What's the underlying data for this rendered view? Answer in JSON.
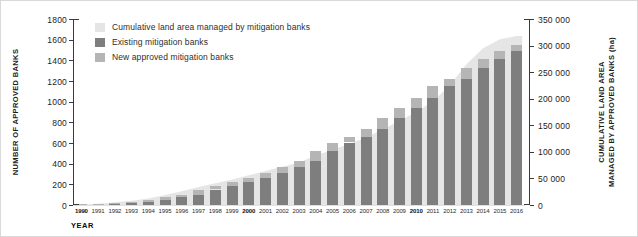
{
  "chart_data": {
    "type": "bar",
    "subtype": "stacked-bars-with-background-area",
    "categories": [
      "1990",
      "1991",
      "1992",
      "1993",
      "1994",
      "1995",
      "1996",
      "1997",
      "1998",
      "1999",
      "2000",
      "2001",
      "2002",
      "2003",
      "2004",
      "2005",
      "2006",
      "2007",
      "2008",
      "2009",
      "2010",
      "2011",
      "2012",
      "2013",
      "2014",
      "2015",
      "2016"
    ],
    "series": [
      {
        "name": "Cumulative land area managed by mitigation banks",
        "type": "area",
        "axis": "right",
        "color": "#e5e5e5",
        "values": [
          1000,
          2500,
          5000,
          8000,
          12000,
          19000,
          26000,
          34000,
          41000,
          48000,
          56000,
          64000,
          72000,
          80000,
          93000,
          104000,
          115000,
          127000,
          142000,
          158000,
          175000,
          195000,
          225000,
          265000,
          295000,
          312000,
          318000
        ]
      },
      {
        "name": "Existing mitigation banks",
        "type": "bar",
        "stack": "banks",
        "axis": "left",
        "color": "#7e7e7e",
        "values": [
          5,
          8,
          14,
          24,
          32,
          45,
          75,
          100,
          150,
          185,
          220,
          258,
          310,
          365,
          430,
          525,
          605,
          660,
          735,
          845,
          940,
          1040,
          1150,
          1220,
          1330,
          1415,
          1490
        ]
      },
      {
        "name": "New approved mitigation banks",
        "type": "bar",
        "stack": "banks",
        "axis": "left",
        "color": "#b5b5b5",
        "values": [
          3,
          6,
          10,
          8,
          13,
          30,
          25,
          50,
          35,
          35,
          38,
          52,
          55,
          65,
          95,
          80,
          55,
          75,
          110,
          95,
          100,
          110,
          70,
          110,
          85,
          75,
          55
        ]
      }
    ],
    "left_axis": {
      "title": "NUMBER OF APPROVED BANKS",
      "min": 0,
      "max": 1800,
      "step": 200
    },
    "right_axis": {
      "title_lines": [
        "CUMULATIVE LAND AREA",
        "MANAGED BY APPROVED BANKS (ha)"
      ],
      "min": 0,
      "max": 350000,
      "step": 50000,
      "thousands_separator": " "
    },
    "x_axis": {
      "title": "YEAR",
      "bold_labels": [
        "1990",
        "2000",
        "2010"
      ]
    },
    "legend_position": "top-left-inside",
    "grid": false
  }
}
